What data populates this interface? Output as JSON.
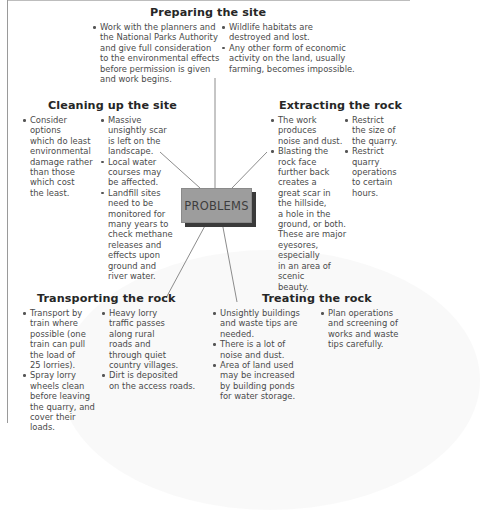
{
  "center": {
    "label": "PROBLEMS"
  },
  "colors": {
    "center_fill": "#9d9d9d",
    "center_shadow": "#3a3a3a",
    "heading_text": "#262626",
    "body_text": "#4a4a4a",
    "connector": "#8c8c8c"
  },
  "sections": {
    "preparing": {
      "title": "Preparing the site",
      "columns": [
        [
          "Work with the planners and\nthe National Parks Authority\nand give full consideration\nto the environmental effects\nbefore permission is given\nand work begins."
        ],
        [
          "Wildlife habitats are\ndestroyed and lost.",
          "Any other form of economic\nactivity on the land, usually\nfarming, becomes impossible."
        ]
      ]
    },
    "cleaning": {
      "title": "Cleaning up the site",
      "columns": [
        [
          "Consider\noptions\nwhich do least\nenvironmental\ndamage rather\nthan those\nwhich cost\nthe least."
        ],
        [
          "Massive\nunsightly scar\nis left on the\nlandscape.",
          "Local water\ncourses may\nbe affected.",
          "Landfill sites\nneed to be\nmonitored for\nmany years to\ncheck methane\nreleases and\neffects upon\nground and\nriver water."
        ]
      ]
    },
    "extracting": {
      "title": "Extracting the rock",
      "columns": [
        [
          "The work\nproduces\nnoise and dust.",
          "Blasting the\nrock face\nfurther back\ncreates a\ngreat scar in\nthe hillside,\na hole in the\nground, or both.\nThese are major\neyesores, especially\nin an area of scenic\nbeauty."
        ],
        [
          "Restrict\nthe size of\nthe quarry.",
          "Restrict\nquarry\noperations\nto certain\nhours."
        ]
      ]
    },
    "transporting": {
      "title": "Transporting the rock",
      "columns": [
        [
          "Transport by\ntrain where\npossible (one\ntrain can pull\nthe load of\n25 lorries).",
          "Spray lorry\nwheels clean\nbefore leaving\nthe quarry, and\ncover their loads."
        ],
        [
          "Heavy lorry\ntraffic passes\nalong rural\nroads and\nthrough quiet\ncountry villages.",
          "Dirt is deposited\non the access roads."
        ]
      ]
    },
    "treating": {
      "title": "Treating the rock",
      "columns": [
        [
          "Unsightly buildings\nand waste tips are\nneeded.",
          "There is a lot of\nnoise and dust.",
          "Area of land used\nmay be increased\nby building ponds\nfor water storage."
        ],
        [
          "Plan operations\nand screening of\nworks and waste\ntips carefully."
        ]
      ]
    }
  }
}
